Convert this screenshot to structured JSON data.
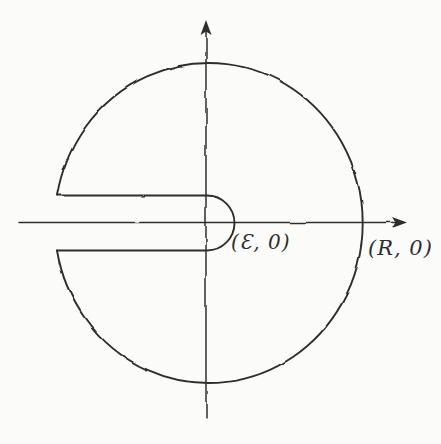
{
  "figure": {
    "labels": {
      "epsilon_point": "(Ɛ, 0)",
      "r_point": "(R, 0)"
    },
    "icons": {
      "x_axis_arrow": "arrowhead-right-icon",
      "y_axis_arrow": "arrowhead-up-icon"
    },
    "colors": {
      "ink": "#2e2e2e",
      "paper": "#fbfbf9"
    }
  }
}
